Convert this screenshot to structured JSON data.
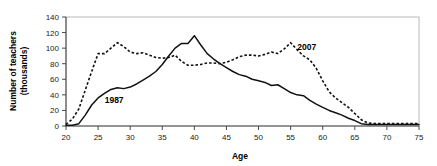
{
  "chart_data": {
    "type": "line",
    "title": "",
    "xlabel": "Age",
    "ylabel": "Number of teachers (thousands)",
    "ylabel_line1": "Number of teachers",
    "ylabel_line2": "(thousands)",
    "xlim": [
      20,
      75
    ],
    "ylim": [
      0,
      140
    ],
    "xticks": [
      20,
      25,
      30,
      35,
      40,
      45,
      50,
      55,
      60,
      65,
      70,
      75
    ],
    "yticks": [
      0,
      20,
      40,
      60,
      80,
      100,
      120,
      140
    ],
    "grid": false,
    "legend_position": "inline-annotations",
    "annotations": [
      {
        "text": "1987",
        "x": 27.5,
        "y": 30
      },
      {
        "text": "2007",
        "x": 57.5,
        "y": 98
      }
    ],
    "x": [
      20,
      21,
      22,
      23,
      24,
      25,
      26,
      27,
      28,
      29,
      30,
      31,
      32,
      33,
      34,
      35,
      36,
      37,
      38,
      39,
      40,
      41,
      42,
      43,
      44,
      45,
      46,
      47,
      48,
      49,
      50,
      51,
      52,
      53,
      54,
      55,
      56,
      57,
      58,
      59,
      60,
      61,
      62,
      63,
      64,
      65,
      66,
      67,
      68,
      69,
      70,
      71,
      72,
      73,
      74,
      75
    ],
    "series": [
      {
        "name": "1987",
        "style": "solid",
        "values": [
          1,
          1,
          3,
          14,
          27,
          36,
          42,
          47,
          49,
          48,
          50,
          54,
          59,
          64,
          70,
          79,
          90,
          100,
          106,
          106,
          116,
          104,
          93,
          86,
          80,
          75,
          70,
          66,
          64,
          60,
          58,
          56,
          52,
          53,
          48,
          43,
          40,
          39,
          33,
          28,
          24,
          20,
          17,
          14,
          10,
          7,
          3,
          2,
          2,
          2,
          2,
          2,
          2,
          2,
          2,
          2
        ]
      },
      {
        "name": "2007",
        "style": "dashed",
        "values": [
          2,
          9,
          22,
          46,
          70,
          93,
          93,
          100,
          107,
          102,
          95,
          93,
          94,
          91,
          88,
          87,
          88,
          91,
          83,
          78,
          78,
          79,
          81,
          81,
          80,
          82,
          85,
          89,
          91,
          91,
          90,
          92,
          95,
          93,
          99,
          107,
          98,
          90,
          85,
          74,
          58,
          44,
          36,
          30,
          24,
          16,
          8,
          4,
          3,
          3,
          3,
          3,
          3,
          3,
          3,
          3
        ]
      }
    ]
  },
  "geometry": {
    "plot_left": 66,
    "plot_right": 419,
    "plot_top": 17,
    "plot_bottom": 126
  }
}
